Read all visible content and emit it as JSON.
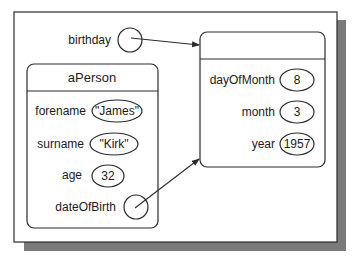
{
  "diagram": {
    "colors": {
      "stroke": "#2a2a2a",
      "shadow": "#7a7a7a",
      "background": "#ffffff"
    },
    "variable": {
      "name": "birthday"
    },
    "person": {
      "title": "aPerson",
      "fields": [
        {
          "name": "forename",
          "value": "\"James\""
        },
        {
          "name": "surname",
          "value": "\"Kirk\""
        },
        {
          "name": "age",
          "value": "32"
        },
        {
          "name": "dateOfBirth",
          "value": ""
        }
      ]
    },
    "date": {
      "title": "",
      "fields": [
        {
          "name": "dayOfMonth",
          "value": "8"
        },
        {
          "name": "month",
          "value": "3"
        },
        {
          "name": "year",
          "value": "1957"
        }
      ]
    },
    "references": [
      {
        "from": "birthday",
        "to": "date"
      },
      {
        "from": "person.dateOfBirth",
        "to": "date"
      }
    ]
  }
}
